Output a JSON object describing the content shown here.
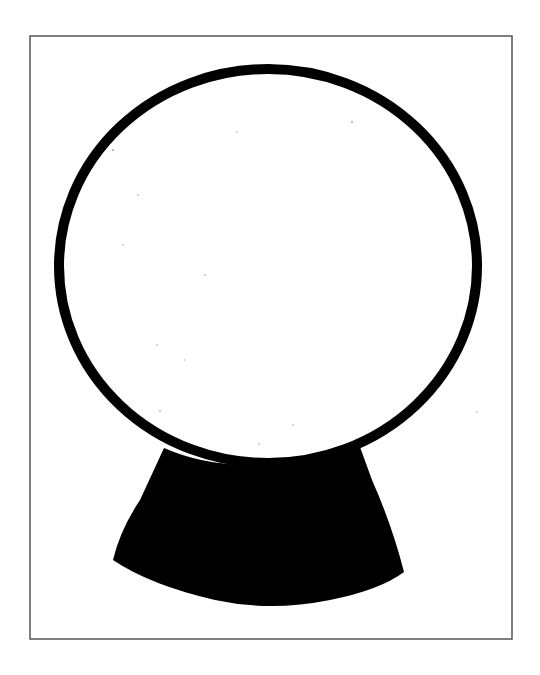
{
  "page": {
    "background_color": "#ffffff"
  },
  "illustration": {
    "subject": "snow-globe",
    "style": "black ink coloring-page outline",
    "ink_color": "#000000",
    "frame": {
      "color": "#555555",
      "x": 30,
      "y": 36,
      "width": 482,
      "height": 603,
      "stroke_width": 1.5
    },
    "globe": {
      "cx": 268,
      "cy": 266,
      "rx": 209,
      "ry": 197,
      "stroke_width": 10,
      "fill": "#ffffff"
    },
    "base": {
      "fill": "#000000",
      "top_left": [
        164,
        450
      ],
      "top_right": [
        360,
        450
      ],
      "bottom_left": [
        113,
        560
      ],
      "bottom_right": [
        403,
        572
      ],
      "bottom_lowest_y": 608
    }
  }
}
